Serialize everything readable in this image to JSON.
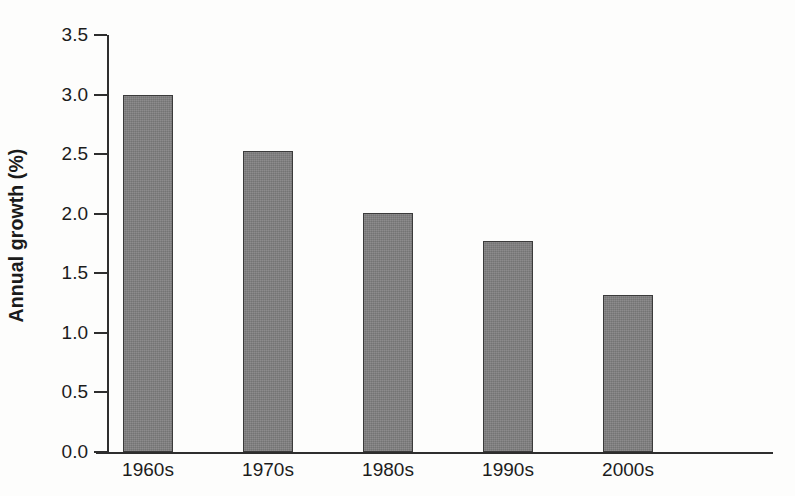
{
  "chart_data": {
    "type": "bar",
    "title": "",
    "subtitle": "",
    "xlabel": "",
    "ylabel": "Annual growth (%)",
    "categories": [
      "1960s",
      "1970s",
      "1980s",
      "1990s",
      "2000s"
    ],
    "values": [
      3.0,
      2.53,
      2.01,
      1.77,
      1.32
    ],
    "series": [
      {
        "name": "Annual growth",
        "values": [
          3.0,
          2.53,
          2.01,
          1.77,
          1.32
        ]
      }
    ],
    "ylim": [
      0.0,
      3.5
    ],
    "ytick_labels": [
      "0.0",
      "0.5",
      "1.0",
      "1.5",
      "2.0",
      "2.5",
      "3.0",
      "3.5"
    ],
    "ytick_values": [
      0.0,
      0.5,
      1.0,
      1.5,
      2.0,
      2.5,
      3.0,
      3.5
    ],
    "grid": false,
    "legend": false,
    "legend_position": "none",
    "bar_color": "#807f80",
    "bar_edge_color": "#3b3b3b",
    "axis_color": "#2e2e2e",
    "background_color": "#fdfdfc",
    "text_color": "#1c1c1c"
  },
  "axis": {
    "y_title": "Annual growth (%)"
  }
}
